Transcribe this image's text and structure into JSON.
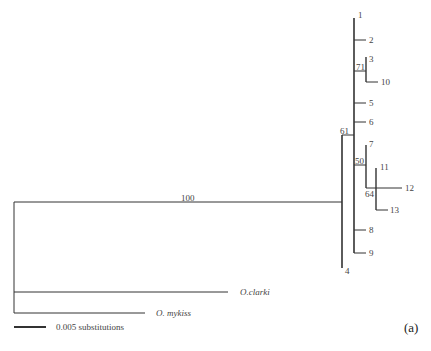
{
  "figure": {
    "panel_label": "(a)",
    "scale_bar_label": "0.005 substitutions",
    "line_color": "#333333"
  },
  "tips": {
    "t1": "1",
    "t2": "2",
    "t3": "3",
    "t10": "10",
    "t5": "5",
    "t6": "6",
    "t7": "7",
    "t11": "11",
    "t12": "12",
    "t13": "13",
    "t8": "8",
    "t9": "9",
    "t4": "4",
    "clarki": "O.clarki",
    "mykiss": "O. mykiss"
  },
  "support": {
    "root_ingroup": "100",
    "node_61": "61",
    "node_71": "71",
    "node_50": "50",
    "node_64": "64"
  }
}
